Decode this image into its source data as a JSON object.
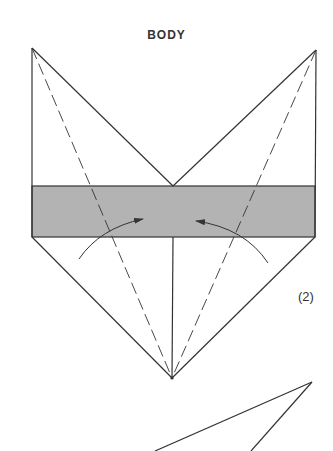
{
  "title": "BODY",
  "step_label": "(2)",
  "colors": {
    "line": "#333333",
    "band_fill": "#b3b3b3",
    "background": "#ffffff"
  },
  "diagram": {
    "elements": [
      "solid-outline",
      "shaded-band",
      "dashed-fold-left",
      "dashed-fold-right",
      "center-crease",
      "curved-arrow-left",
      "curved-arrow-right",
      "partial-next-diagram"
    ]
  }
}
